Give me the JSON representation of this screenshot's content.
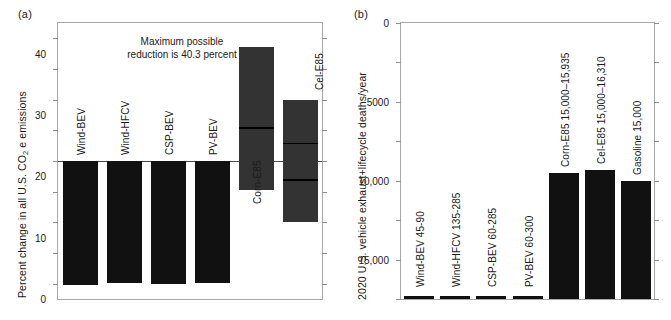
{
  "figure": {
    "panel_a_label": "(a)",
    "panel_b_label": "(b)"
  },
  "panel_a": {
    "ylabel_pre": "Percent change in all U.S. CO",
    "ylabel_sub": "2",
    "ylabel_post": "e emissions",
    "annotation_line1": "Maximum possible",
    "annotation_line2": "reduction is 40.3 percent",
    "ticklabels": [
      "40",
      "30",
      "20",
      "10",
      "0",
      "−10",
      "−20",
      "−30",
      "−40"
    ]
  },
  "panel_b": {
    "ylabel": "2020 U.S. vehicle exhaust+lifecycle deaths/year",
    "ticklabels": [
      "35,000",
      "30,000",
      "25,000",
      "20,000",
      "15,000",
      "10,000",
      "5000",
      "0"
    ]
  },
  "chart_data": [
    {
      "type": "bar",
      "panel": "(a)",
      "title": "",
      "xlabel": "",
      "ylabel": "Percent change in all U.S. CO2e emissions",
      "ylim": [
        -45,
        45
      ],
      "yticks": [
        40,
        30,
        20,
        10,
        0,
        -10,
        -20,
        -30,
        -40
      ],
      "grid": false,
      "legend": "none",
      "annotation": "Maximum possible reduction is 40.3 percent",
      "categories": [
        "Wind-BEV",
        "Wind-HFCV",
        "CSP-BEV",
        "PV-BEV",
        "Corn-E85",
        "Cel-E85"
      ],
      "bars": [
        {
          "label": "Wind-BEV",
          "style": "solid",
          "low": -40.3,
          "high": 0.0,
          "mid": null
        },
        {
          "label": "Wind-HFCV",
          "style": "solid",
          "low": -39.8,
          "high": 0.0,
          "mid": null
        },
        {
          "label": "CSP-BEV",
          "style": "solid",
          "low": -40.0,
          "high": 0.0,
          "mid": null
        },
        {
          "label": "PV-BEV",
          "style": "solid",
          "low": -39.9,
          "high": 0.0,
          "mid": null
        },
        {
          "label": "Corn-E85",
          "style": "range",
          "low": -9.3,
          "high": 37.3,
          "mid": 11.0
        },
        {
          "label": "Cel-E85",
          "style": "range",
          "low": -20.0,
          "high": 20.0,
          "mid": 6.0,
          "mid2": -6.0
        }
      ]
    },
    {
      "type": "bar",
      "panel": "(b)",
      "title": "",
      "xlabel": "",
      "ylabel": "2020 U.S. vehicle exhaust+lifecycle deaths/year",
      "ylim": [
        0,
        35000
      ],
      "yticks": [
        0,
        5000,
        10000,
        15000,
        20000,
        25000,
        30000,
        35000
      ],
      "grid": false,
      "legend": "none",
      "categories": [
        "Wind-BEV 45-90",
        "Wind-HFCV 135-285",
        "CSP-BEV 60-285",
        "PV-BEV 60-300",
        "Corn-E85 15,000–15,935",
        "Cel-E85 15,000–16,310",
        "Gasoline 15,000"
      ],
      "values": [
        90,
        285,
        285,
        300,
        15935,
        16310,
        15000
      ]
    }
  ]
}
